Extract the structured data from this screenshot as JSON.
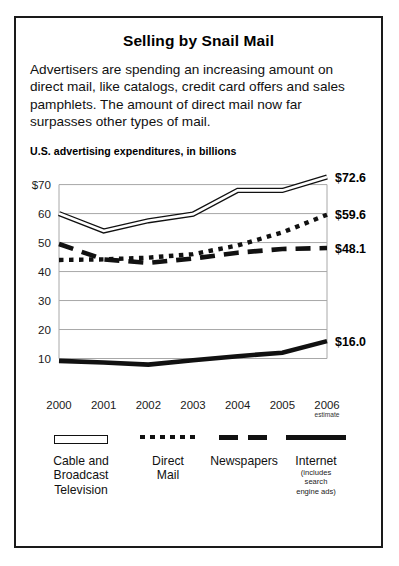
{
  "title": "Selling by Snail Mail",
  "intro": "Advertisers are spending an increasing amount on direct mail, like catalogs, credit card offers and sales pamphlets. The amount of direct mail now far surpasses other types of mail.",
  "subtitle": "U.S. advertising expenditures, in billions",
  "axis": {
    "y_ticks": [
      "$70",
      "60",
      "50",
      "40",
      "30",
      "20",
      "10"
    ],
    "x_ticks": [
      "2000",
      "2001",
      "2002",
      "2003",
      "2004",
      "2005",
      "2006"
    ],
    "x_2006_note": "estimate"
  },
  "end_labels": {
    "cable": "$72.6",
    "direct_mail": "$59.6",
    "newspapers": "$48.1",
    "internet": "$16.0"
  },
  "legend": [
    {
      "name": "cable",
      "label": "Cable and\nBroadcast\nTelevision",
      "label_lines": [
        "Cable and",
        "Broadcast",
        "Television"
      ],
      "note": "",
      "style": "hollow"
    },
    {
      "name": "direct-mail",
      "label": "Direct Mail",
      "label_lines": [
        "Direct",
        "Mail"
      ],
      "note": "",
      "style": "dotted"
    },
    {
      "name": "newspapers",
      "label": "Newspapers",
      "label_lines": [
        "Newspapers"
      ],
      "note": "",
      "style": "dashed"
    },
    {
      "name": "internet",
      "label": "Internet",
      "label_lines": [
        "Internet"
      ],
      "note_lines": [
        "(includes",
        "search",
        "engine ads)"
      ],
      "style": "solid"
    }
  ],
  "colors": {
    "ink": "#111111",
    "grid": "#a8a8a8",
    "frame": "#1a1a1a",
    "background": "#ffffff"
  },
  "chart_data": {
    "type": "line",
    "title": "U.S. advertising expenditures, in billions",
    "xlabel": "",
    "ylabel": "",
    "x": [
      "2000",
      "2001",
      "2002",
      "2003",
      "2004",
      "2005",
      "2006"
    ],
    "ylim": [
      5,
      74
    ],
    "y_gridlines": [
      10,
      20,
      30,
      40,
      50,
      60,
      70
    ],
    "grid": true,
    "legend_position": "bottom",
    "series": [
      {
        "name": "Cable and Broadcast Television",
        "style": "hollow-double-line",
        "values": [
          60.0,
          54.0,
          57.5,
          59.8,
          68.0,
          68.0,
          72.6
        ],
        "end_label": "$72.6"
      },
      {
        "name": "Direct Mail",
        "style": "dotted",
        "values": [
          44.0,
          44.2,
          44.8,
          46.0,
          49.0,
          53.5,
          59.6
        ],
        "end_label": "$59.6"
      },
      {
        "name": "Newspapers",
        "style": "dashed",
        "values": [
          49.5,
          44.2,
          43.0,
          44.5,
          46.5,
          47.8,
          48.1
        ],
        "end_label": "$48.1"
      },
      {
        "name": "Internet (includes search engine ads)",
        "style": "solid-thick",
        "values": [
          9.2,
          8.6,
          7.9,
          9.4,
          10.8,
          12.0,
          16.0
        ],
        "end_label": "$16.0"
      }
    ]
  }
}
